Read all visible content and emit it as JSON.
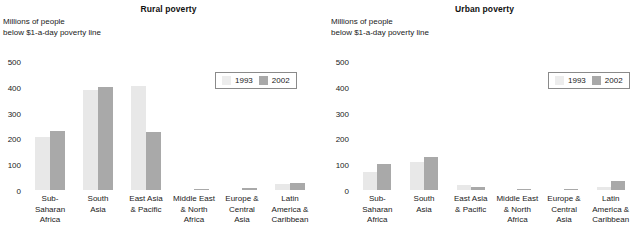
{
  "axis_caption": "Millions of people\nbelow $1-a-day poverty line",
  "legend": {
    "items": [
      {
        "label": "1993",
        "color": "#ededed"
      },
      {
        "label": "2002",
        "color": "#a9a9a9"
      }
    ]
  },
  "colors": {
    "series_1993": "#e8e8e8",
    "series_2002": "#a9a9a9",
    "legend_border": "#8a8a8a",
    "text": "#1a1a1a",
    "background": "#ffffff"
  },
  "categories": [
    "Sub-\nSaharan\nAfrica",
    "South\nAsia",
    "East Asia\n& Pacific",
    "Middle East\n& North\nAfrica",
    "Europe &\nCentral\nAsia",
    "Latin\nAmerica &\nCaribbean"
  ],
  "ticks": [
    "500",
    "400",
    "300",
    "200",
    "100",
    "0"
  ],
  "chart_data": [
    {
      "type": "bar",
      "title": "Rural poverty",
      "xlabel": "",
      "ylabel": "Millions of people below $1-a-day poverty line",
      "ylim": [
        0,
        500
      ],
      "yticks": [
        0,
        100,
        200,
        300,
        400,
        500
      ],
      "grid": false,
      "legend_position": "upper-right",
      "categories": [
        "Sub-Saharan Africa",
        "South Asia",
        "East Asia & Pacific",
        "Middle East & North Africa",
        "Europe & Central Asia",
        "Latin America & Caribbean"
      ],
      "series": [
        {
          "name": "1993",
          "color": "#e8e8e8",
          "values": [
            210,
            392,
            408,
            5,
            5,
            28
          ]
        },
        {
          "name": "2002",
          "color": "#a9a9a9",
          "values": [
            232,
            403,
            228,
            8,
            10,
            33
          ]
        }
      ]
    },
    {
      "type": "bar",
      "title": "Urban poverty",
      "xlabel": "",
      "ylabel": "Millions of people below $1-a-day poverty line",
      "ylim": [
        0,
        500
      ],
      "yticks": [
        0,
        100,
        200,
        300,
        400,
        500
      ],
      "grid": false,
      "legend_position": "upper-right",
      "categories": [
        "Sub-Saharan Africa",
        "South Asia",
        "East Asia & Pacific",
        "Middle East & North Africa",
        "Europe & Central Asia",
        "Latin America & Caribbean"
      ],
      "series": [
        {
          "name": "1993",
          "color": "#e8e8e8",
          "values": [
            72,
            112,
            22,
            4,
            5,
            15
          ]
        },
        {
          "name": "2002",
          "color": "#a9a9a9",
          "values": [
            105,
            133,
            16,
            6,
            9,
            40
          ]
        }
      ]
    }
  ]
}
